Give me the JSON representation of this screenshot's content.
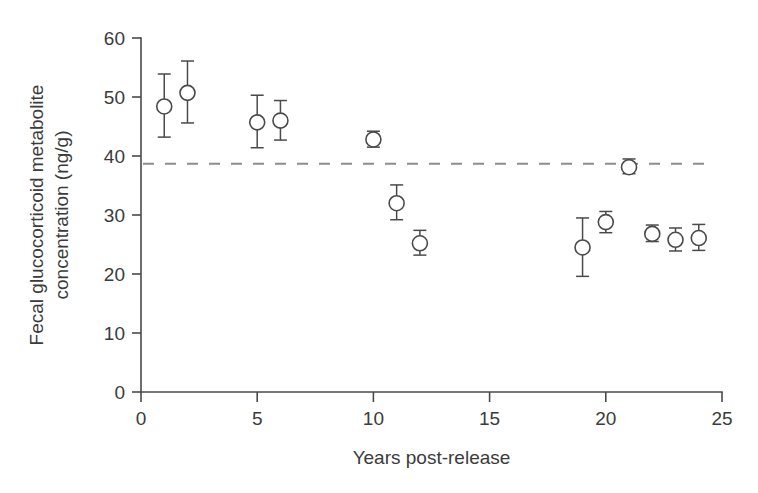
{
  "chart_data": {
    "type": "scatter",
    "title": "",
    "xlabel": "Years post-release",
    "ylabel": "Fecal glucocorticoid metabolite concentration (ng/g)",
    "ylabel_line1": "Fecal glucocorticoid metabolite",
    "ylabel_line2": "concentration (ng/g)",
    "xlim": [
      0,
      25
    ],
    "ylim": [
      0,
      60
    ],
    "xticks": [
      0,
      5,
      10,
      15,
      20,
      25
    ],
    "xticklabels": [
      "0",
      "5",
      "10",
      "15",
      "20",
      "25"
    ],
    "yticks": [
      0,
      10,
      20,
      30,
      40,
      50,
      60
    ],
    "yticklabels": [
      "0",
      "10",
      "20",
      "30",
      "40",
      "50",
      "60"
    ],
    "grid": false,
    "legend": "none",
    "marker_style": "open-circle",
    "error_bars": "vertical",
    "reference_line": {
      "type": "horizontal-dashed",
      "y": 38.7,
      "label": "",
      "color": "#8c8c8c"
    },
    "colors": {
      "marker_edge": "#4a4a4a",
      "marker_face": "#ffffff",
      "axis": "#4a4a4a",
      "text": "#3b3b3b",
      "reference": "#8c8c8c",
      "background": "#ffffff"
    },
    "x": [
      1,
      2,
      5,
      6,
      10,
      11,
      12,
      19,
      20,
      21,
      22,
      23,
      24
    ],
    "values": [
      48.4,
      50.7,
      45.7,
      46.0,
      42.8,
      32.0,
      25.2,
      24.5,
      28.8,
      38.1,
      26.8,
      25.8,
      26.1
    ],
    "err_low": [
      43.2,
      45.6,
      41.4,
      42.7,
      41.5,
      29.2,
      23.2,
      19.6,
      27.0,
      37.0,
      25.5,
      23.9,
      24.0
    ],
    "err_high": [
      53.9,
      56.1,
      50.3,
      49.4,
      44.2,
      35.1,
      27.4,
      29.5,
      30.6,
      39.5,
      28.3,
      27.8,
      28.4
    ],
    "points": [
      {
        "x": 1,
        "y": 48.4,
        "low": 43.2,
        "high": 53.9
      },
      {
        "x": 2,
        "y": 50.7,
        "low": 45.6,
        "high": 56.1
      },
      {
        "x": 5,
        "y": 45.7,
        "low": 41.4,
        "high": 50.3
      },
      {
        "x": 6,
        "y": 46.0,
        "low": 42.7,
        "high": 49.4
      },
      {
        "x": 10,
        "y": 42.8,
        "low": 41.5,
        "high": 44.2
      },
      {
        "x": 11,
        "y": 32.0,
        "low": 29.2,
        "high": 35.1
      },
      {
        "x": 12,
        "y": 25.2,
        "low": 23.2,
        "high": 27.4
      },
      {
        "x": 19,
        "y": 24.5,
        "low": 19.6,
        "high": 29.5
      },
      {
        "x": 20,
        "y": 28.8,
        "low": 27.0,
        "high": 30.6
      },
      {
        "x": 21,
        "y": 38.1,
        "low": 37.0,
        "high": 39.5
      },
      {
        "x": 22,
        "y": 26.8,
        "low": 25.5,
        "high": 28.3
      },
      {
        "x": 23,
        "y": 25.8,
        "low": 23.9,
        "high": 27.8
      },
      {
        "x": 24,
        "y": 26.1,
        "low": 24.0,
        "high": 28.4
      }
    ]
  }
}
